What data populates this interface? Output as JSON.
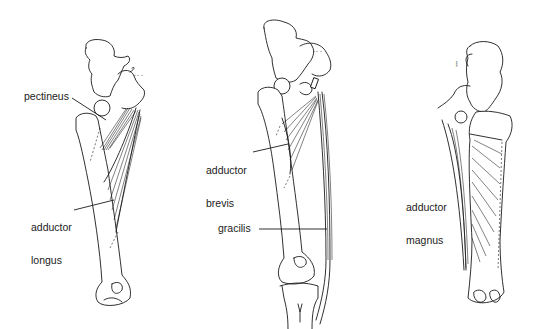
{
  "figures": [
    {
      "id": "left",
      "view": "anterior",
      "labels": [
        {
          "name": "pectineus",
          "text": "pectineus"
        },
        {
          "name": "adductor-longus",
          "line1": "adductor",
          "line2": "longus"
        }
      ]
    },
    {
      "id": "middle",
      "view": "anterior",
      "labels": [
        {
          "name": "adductor-brevis",
          "line1": "adductor",
          "line2": "brevis"
        },
        {
          "name": "gracilis",
          "text": "gracilis"
        }
      ]
    },
    {
      "id": "right",
      "view": "posterior",
      "labels": [
        {
          "name": "adductor-magnus",
          "line1": "adductor",
          "line2": "magnus"
        }
      ]
    }
  ],
  "colors": {
    "line": "#1a1a1a",
    "text": "#222222",
    "background": "#ffffff"
  }
}
